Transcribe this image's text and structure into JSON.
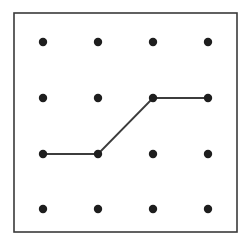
{
  "diagram": {
    "type": "dot-grid",
    "rows": 4,
    "cols": 4,
    "colors": {
      "background": "#ffffff",
      "border": "#3a3a3a",
      "dot": "#1e1e1e",
      "line": "#3c3c3c"
    },
    "frame": {
      "x": 14,
      "y": 13,
      "width": 223,
      "height": 219
    },
    "col_x": [
      43,
      98,
      153,
      208
    ],
    "row_y": [
      42,
      98,
      154,
      209
    ],
    "dot_radius": 4.2,
    "path": [
      {
        "row": 2,
        "col": 0
      },
      {
        "row": 2,
        "col": 1
      },
      {
        "row": 1,
        "col": 2
      },
      {
        "row": 1,
        "col": 3
      }
    ]
  }
}
